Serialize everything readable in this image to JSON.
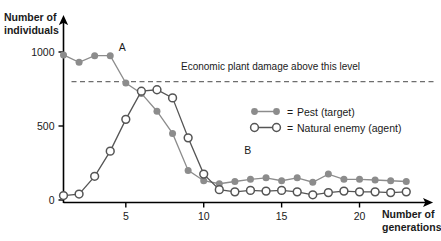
{
  "chart_data": {
    "type": "line",
    "title": "",
    "xlabel": "Number of generations",
    "ylabel": "Number of individuals",
    "xlim": [
      1,
      23
    ],
    "ylim": [
      0,
      1080
    ],
    "grid": false,
    "legend_position": "center-right",
    "x_ticks": [
      5,
      10,
      15,
      20
    ],
    "y_ticks": [
      0,
      500,
      1000
    ],
    "x": [
      1,
      2,
      3,
      4,
      5,
      6,
      7,
      8,
      9,
      10,
      11,
      12,
      13,
      14,
      15,
      16,
      17,
      18,
      19,
      20,
      21,
      22,
      23
    ],
    "series": [
      {
        "name": "Pest (target)",
        "marker": "filled-circle",
        "color": "#8c8c8c",
        "values": [
          980,
          930,
          975,
          975,
          790,
          720,
          600,
          450,
          200,
          130,
          110,
          125,
          140,
          150,
          130,
          150,
          120,
          175,
          140,
          140,
          135,
          130,
          125
        ]
      },
      {
        "name": "Natural enemy (agent)",
        "marker": "open-circle",
        "color": "#555555",
        "values": [
          30,
          40,
          160,
          330,
          545,
          735,
          745,
          690,
          420,
          175,
          70,
          55,
          65,
          60,
          65,
          55,
          35,
          50,
          60,
          55,
          55,
          50,
          55
        ]
      }
    ],
    "threshold": {
      "value": 800,
      "label": "Economic plant damage above this level",
      "style": "dashed",
      "color": "#6e6e6e"
    },
    "annotations": [
      {
        "text": "A",
        "x": 4.55,
        "y": 1010
      },
      {
        "text": "B",
        "x": 12.6,
        "y": 310
      }
    ]
  },
  "legend": {
    "entries": [
      {
        "prefix": "=",
        "label": "Pest (target)"
      },
      {
        "prefix": "=",
        "label": "Natural enemy (agent)"
      }
    ]
  },
  "axes": {
    "y_title_line1": "Number of",
    "y_title_line2": "individuals",
    "x_title_line1": "Number of",
    "x_title_line2": "generations",
    "y_tick_labels": [
      "0",
      "500",
      "1000"
    ],
    "x_tick_labels": [
      "5",
      "10",
      "15",
      "20"
    ]
  },
  "colors": {
    "pest": "#8c8c8c",
    "enemy_stroke": "#555555",
    "enemy_fill": "#ffffff",
    "axis": "#000000",
    "threshold": "#6e6e6e",
    "text": "#1a1a1a"
  }
}
